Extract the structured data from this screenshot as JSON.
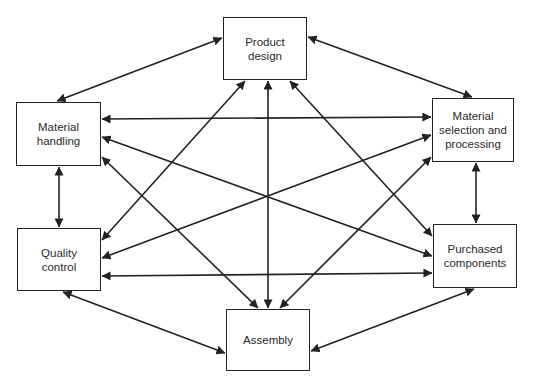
{
  "diagram": {
    "type": "network",
    "colors": {
      "stroke": "#222222",
      "text": "#2a2a2a",
      "background": "#ffffff"
    },
    "nodes": [
      {
        "id": "product_design",
        "label": "Product\ndesign",
        "x": 223,
        "y": 17,
        "w": 84,
        "h": 63
      },
      {
        "id": "material_handling",
        "label": "Material\nhandling",
        "x": 16,
        "y": 102,
        "w": 85,
        "h": 64
      },
      {
        "id": "material_selection",
        "label": "Material\nselection and\nprocessing",
        "x": 432,
        "y": 98,
        "w": 82,
        "h": 64
      },
      {
        "id": "quality_control",
        "label": "Quality\ncontrol",
        "x": 17,
        "y": 228,
        "w": 84,
        "h": 63
      },
      {
        "id": "purchased_components",
        "label": "Purchased\ncomponents",
        "x": 433,
        "y": 224,
        "w": 84,
        "h": 64
      },
      {
        "id": "assembly",
        "label": "Assembly",
        "x": 226,
        "y": 309,
        "w": 84,
        "h": 62
      }
    ],
    "edges": [
      {
        "from": "material_handling",
        "to": "product_design",
        "x1": 57,
        "y1": 101,
        "x2": 222,
        "y2": 38,
        "bidirectional": true
      },
      {
        "from": "product_design",
        "to": "material_selection",
        "x1": 308,
        "y1": 37,
        "x2": 472,
        "y2": 97,
        "bidirectional": true
      },
      {
        "from": "material_handling",
        "to": "quality_control",
        "x1": 59,
        "y1": 167,
        "x2": 59,
        "y2": 227,
        "bidirectional": true
      },
      {
        "from": "material_selection",
        "to": "purchased_components",
        "x1": 476,
        "y1": 163,
        "x2": 476,
        "y2": 223,
        "bidirectional": true
      },
      {
        "from": "quality_control",
        "to": "assembly",
        "x1": 63,
        "y1": 292,
        "x2": 225,
        "y2": 353,
        "bidirectional": true
      },
      {
        "from": "assembly",
        "to": "purchased_components",
        "x1": 311,
        "y1": 351,
        "x2": 474,
        "y2": 289,
        "bidirectional": true
      },
      {
        "from": "material_handling",
        "to": "material_selection",
        "x1": 102,
        "y1": 119,
        "x2": 431,
        "y2": 117,
        "bidirectional": true
      },
      {
        "from": "quality_control",
        "to": "purchased_components",
        "x1": 102,
        "y1": 276,
        "x2": 432,
        "y2": 273,
        "bidirectional": true
      },
      {
        "from": "product_design",
        "to": "quality_control",
        "x1": 245,
        "y1": 81,
        "x2": 102,
        "y2": 240,
        "bidirectional": true
      },
      {
        "from": "product_design",
        "to": "assembly",
        "x1": 268,
        "y1": 81,
        "x2": 268,
        "y2": 308,
        "bidirectional": true
      },
      {
        "from": "product_design",
        "to": "purchased_components",
        "x1": 290,
        "y1": 81,
        "x2": 432,
        "y2": 236,
        "bidirectional": true
      },
      {
        "from": "material_handling",
        "to": "purchased_components",
        "x1": 102,
        "y1": 137,
        "x2": 432,
        "y2": 256,
        "bidirectional": true
      },
      {
        "from": "material_handling",
        "to": "assembly",
        "x1": 102,
        "y1": 157,
        "x2": 258,
        "y2": 308,
        "bidirectional": true
      },
      {
        "from": "material_selection",
        "to": "quality_control",
        "x1": 431,
        "y1": 135,
        "x2": 102,
        "y2": 258,
        "bidirectional": true
      },
      {
        "from": "material_selection",
        "to": "assembly",
        "x1": 431,
        "y1": 157,
        "x2": 280,
        "y2": 308,
        "bidirectional": true
      }
    ]
  }
}
